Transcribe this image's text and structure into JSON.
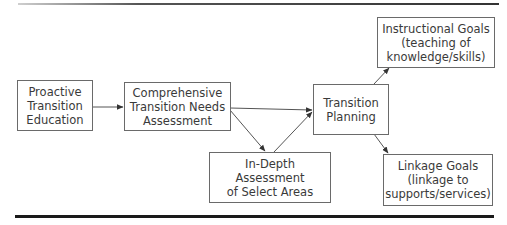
{
  "diagram": {
    "type": "flowchart",
    "nodes": {
      "proactive": {
        "id": "proactive",
        "label": "Proactive\nTransition\nEducation"
      },
      "comprehensive": {
        "id": "comprehensive",
        "label": "Comprehensive\nTransition Needs\nAssessment"
      },
      "indepth": {
        "id": "indepth",
        "label": "In-Depth Assessment\nof Select Areas"
      },
      "planning": {
        "id": "planning",
        "label": "Transition\nPlanning"
      },
      "instructional": {
        "id": "instructional",
        "label": "Instructional Goals\n(teaching of\nknowledge/skills)"
      },
      "linkage": {
        "id": "linkage",
        "label": "Linkage Goals\n(linkage to\nsupports/services)"
      }
    },
    "edges": [
      {
        "from": "proactive",
        "to": "comprehensive"
      },
      {
        "from": "comprehensive",
        "to": "planning"
      },
      {
        "from": "comprehensive",
        "to": "indepth"
      },
      {
        "from": "indepth",
        "to": "planning"
      },
      {
        "from": "planning",
        "to": "instructional"
      },
      {
        "from": "planning",
        "to": "linkage"
      }
    ],
    "colors": {
      "line": "#555555",
      "box_border": "#6a6a6a",
      "text": "#3a3a3a",
      "rule": "#1a1a1a"
    }
  }
}
